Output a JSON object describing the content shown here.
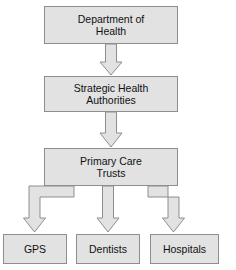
{
  "diagram": {
    "type": "organizational-hierarchy-flowchart",
    "style": {
      "box_fill": "#e2e2e2",
      "box_border": "#8e8e8e",
      "arrow_fill": "#e2e2e2",
      "arrow_border": "#8e8e8e",
      "text_color": "#111111",
      "background": "#ffffff"
    },
    "nodes": [
      {
        "id": "department-of-health",
        "label": "Department of\nHealth",
        "level": 1,
        "x": 44,
        "y": 6,
        "width": 134,
        "height": 38
      },
      {
        "id": "strategic-health-authorities",
        "label": "Strategic Health\nAuthorities",
        "level": 2,
        "x": 44,
        "y": 76,
        "width": 134,
        "height": 36
      },
      {
        "id": "primary-care-trusts",
        "label": "Primary Care\nTrusts",
        "level": 3,
        "x": 44,
        "y": 148,
        "width": 134,
        "height": 38
      },
      {
        "id": "gps",
        "label": "GPS",
        "level": 4,
        "x": 3,
        "y": 234,
        "width": 64,
        "height": 30
      },
      {
        "id": "dentists",
        "label": "Dentists",
        "level": 4,
        "x": 76,
        "y": 234,
        "width": 64,
        "height": 30
      },
      {
        "id": "hospitals",
        "label": "Hospitals",
        "level": 4,
        "x": 150,
        "y": 234,
        "width": 69,
        "height": 30
      }
    ],
    "connectors": [
      {
        "id": "doh-to-sha",
        "from": "department-of-health",
        "to": "strategic-health-authorities",
        "shape": "straight-block-arrow"
      },
      {
        "id": "sha-to-pct",
        "from": "strategic-health-authorities",
        "to": "primary-care-trusts",
        "shape": "straight-block-arrow"
      },
      {
        "id": "pct-to-gps",
        "from": "primary-care-trusts",
        "to": "gps",
        "shape": "elbow-block-arrow-left"
      },
      {
        "id": "pct-to-dentists",
        "from": "primary-care-trusts",
        "to": "dentists",
        "shape": "straight-block-arrow"
      },
      {
        "id": "pct-to-hospitals",
        "from": "primary-care-trusts",
        "to": "hospitals",
        "shape": "elbow-block-arrow-right"
      }
    ]
  }
}
